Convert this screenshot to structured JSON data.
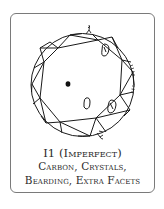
{
  "card": {
    "grade_line": "I1 (Imperfect)",
    "inclusions_line1": "Carbon, Crystals,",
    "inclusions_line2": "Bearding, Extra Facets"
  },
  "diagram": {
    "inclusions": [
      "carbon",
      "crystal",
      "crystal",
      "crystal",
      "bearding",
      "extra-facet"
    ],
    "colors": {
      "line": "#1a1a1a",
      "frame": "#7a7a7a",
      "background": "#ffffff"
    }
  }
}
